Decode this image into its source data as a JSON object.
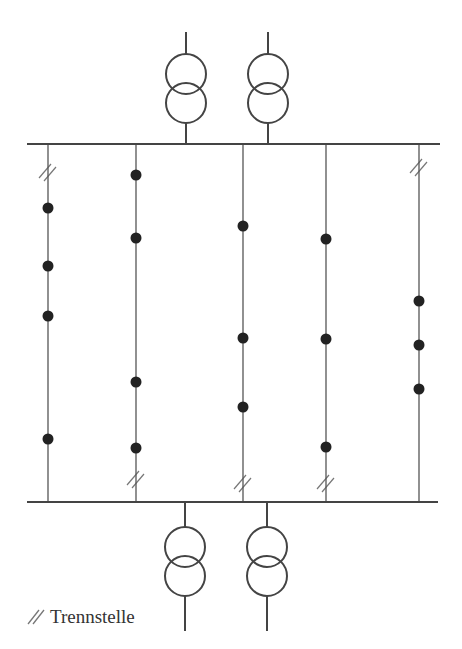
{
  "diagram": {
    "type": "single-line-grid-diagram",
    "colors": {
      "line": "#555555",
      "bus": "#444444",
      "node": "#222222",
      "text": "#333333"
    },
    "top_bus": {
      "x1": 27,
      "x2": 440,
      "y": 144
    },
    "bottom_bus": {
      "x1": 27,
      "x2": 438,
      "y": 502
    },
    "transformers_top": [
      {
        "x": 186,
        "lead_top": 32,
        "circle1_cy": 74,
        "circle2_cy": 103,
        "r": 20
      },
      {
        "x": 268,
        "lead_top": 32,
        "circle1_cy": 74,
        "circle2_cy": 103,
        "r": 20
      }
    ],
    "transformers_bottom": [
      {
        "x": 185,
        "lead_bottom": 631,
        "circle1_cy": 547,
        "circle2_cy": 576,
        "r": 20
      },
      {
        "x": 267,
        "lead_bottom": 631,
        "circle1_cy": 547,
        "circle2_cy": 576,
        "r": 20
      }
    ],
    "feeders": [
      {
        "name": "feeder-1",
        "x": 48,
        "nodes": [
          208,
          266,
          316,
          439
        ],
        "breaks": [
          {
            "position": "top",
            "y": 172
          }
        ]
      },
      {
        "name": "feeder-2",
        "x": 136,
        "nodes": [
          175,
          238,
          382,
          448
        ],
        "breaks": [
          {
            "position": "bottom",
            "y": 479
          }
        ]
      },
      {
        "name": "feeder-3",
        "x": 243,
        "nodes": [
          226,
          338,
          407
        ],
        "breaks": [
          {
            "position": "bottom",
            "y": 483
          }
        ]
      },
      {
        "name": "feeder-4",
        "x": 326,
        "nodes": [
          239,
          339,
          447
        ],
        "breaks": [
          {
            "position": "bottom",
            "y": 483
          }
        ]
      },
      {
        "name": "feeder-5",
        "x": 419,
        "nodes": [
          301,
          345,
          389
        ],
        "breaks": [
          {
            "position": "top",
            "y": 167
          }
        ]
      }
    ]
  },
  "legend": {
    "symbol": "break-point-double-slash",
    "label": "Trennstelle"
  }
}
